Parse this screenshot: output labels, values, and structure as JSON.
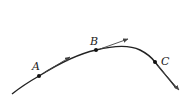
{
  "diagram": {
    "type": "curve-with-tangent-vectors",
    "colors": {
      "curve": "#222222",
      "arrow": "#444444",
      "point": "#111111",
      "label": "#222222"
    },
    "points": [
      {
        "label": "A",
        "x": 39,
        "y": 76
      },
      {
        "label": "B",
        "x": 96,
        "y": 50
      },
      {
        "label": "C",
        "x": 155,
        "y": 62
      }
    ]
  }
}
